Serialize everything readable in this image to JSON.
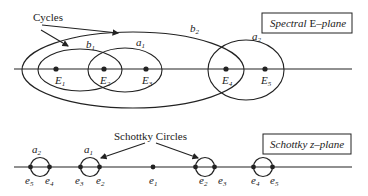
{
  "spectral_plane": {
    "box_label_italic_1": "Spectral ",
    "box_label_roman": "E",
    "box_label_italic_2": "–plane",
    "annotation": "Cycles",
    "points": [
      {
        "name": "E",
        "sub": "1"
      },
      {
        "name": "E",
        "sub": "2"
      },
      {
        "name": "E",
        "sub": "3"
      },
      {
        "name": "E",
        "sub": "4"
      },
      {
        "name": "E",
        "sub": "5"
      }
    ],
    "cycles": [
      {
        "name": "b",
        "sub": "1"
      },
      {
        "name": "a",
        "sub": "1"
      },
      {
        "name": "b",
        "sub": "2"
      },
      {
        "name": "a",
        "sub": "2"
      }
    ]
  },
  "schottky_plane": {
    "box_label": "Schottky z–plane",
    "annotation": "Schottky Circles",
    "points": [
      {
        "name": "e",
        "sub": "5"
      },
      {
        "name": "e",
        "sub": "4"
      },
      {
        "name": "e",
        "sub": "3"
      },
      {
        "name": "e",
        "sub": "2"
      },
      {
        "name": "e",
        "sub": "1"
      },
      {
        "name": "e",
        "sub": "2"
      },
      {
        "name": "e",
        "sub": "3"
      },
      {
        "name": "e",
        "sub": "4"
      },
      {
        "name": "e",
        "sub": "5"
      }
    ],
    "circles": [
      {
        "name": "a",
        "sub": "2"
      },
      {
        "name": "a",
        "sub": "1"
      }
    ]
  },
  "colors": {
    "stroke": "#222222",
    "background": "#ffffff"
  }
}
